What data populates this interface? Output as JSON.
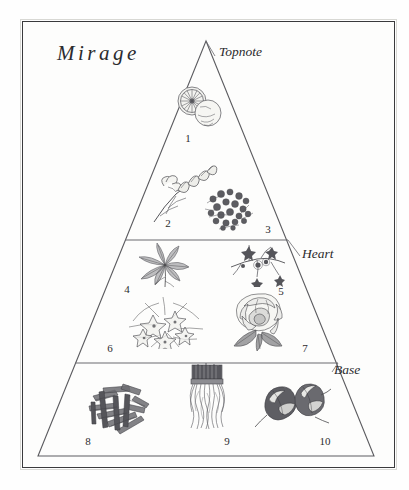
{
  "page": {
    "title": "Mirage",
    "background_color": "#fefefe",
    "frame_color": "#3a3a3c",
    "ink_color": "#4a4a4d"
  },
  "pyramid": {
    "apex": {
      "x": 206,
      "y": 41
    },
    "base_left": {
      "x": 38,
      "y": 456
    },
    "base_right": {
      "x": 374,
      "y": 456
    },
    "dividers_y": [
      240,
      363
    ],
    "bands": [
      {
        "name": "topnote",
        "label": "Topnote",
        "label_x": 219,
        "label_y": 44
      },
      {
        "name": "heart",
        "label": "Heart",
        "label_x": 302,
        "label_y": 246
      },
      {
        "name": "base",
        "label": "Base",
        "label_x": 334,
        "label_y": 362
      }
    ]
  },
  "notes": [
    {
      "number": "1",
      "band": "topnote",
      "icon": "citrus-fruit-icon",
      "art_x": 198,
      "art_y": 107,
      "num_x": 188,
      "num_y": 138
    },
    {
      "number": "2",
      "band": "topnote",
      "icon": "freesia-sprig-icon",
      "art_x": 185,
      "art_y": 188,
      "num_x": 168,
      "num_y": 223
    },
    {
      "number": "3",
      "band": "topnote",
      "icon": "blossom-cluster-icon",
      "art_x": 230,
      "art_y": 208,
      "num_x": 268,
      "num_y": 229
    },
    {
      "number": "4",
      "band": "heart",
      "icon": "leafy-herb-icon",
      "art_x": 165,
      "art_y": 265,
      "num_x": 127,
      "num_y": 289
    },
    {
      "number": "5",
      "band": "heart",
      "icon": "starflower-sprig-icon",
      "art_x": 258,
      "art_y": 264,
      "num_x": 281,
      "num_y": 291
    },
    {
      "number": "6",
      "band": "heart",
      "icon": "jasmine-cluster-icon",
      "art_x": 166,
      "art_y": 322,
      "num_x": 110,
      "num_y": 348
    },
    {
      "number": "7",
      "band": "heart",
      "icon": "rose-bloom-icon",
      "art_x": 258,
      "art_y": 321,
      "num_x": 305,
      "num_y": 348
    },
    {
      "number": "8",
      "band": "base",
      "icon": "wood-shavings-icon",
      "art_x": 120,
      "art_y": 407,
      "num_x": 88,
      "num_y": 441
    },
    {
      "number": "9",
      "band": "base",
      "icon": "vetiver-roots-icon",
      "art_x": 207,
      "art_y": 400,
      "num_x": 227,
      "num_y": 441
    },
    {
      "number": "10",
      "band": "base",
      "icon": "tonka-bean-pods-icon",
      "art_x": 293,
      "art_y": 406,
      "num_x": 325,
      "num_y": 441
    }
  ]
}
